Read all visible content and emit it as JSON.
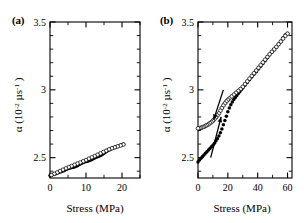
{
  "figure": {
    "panels": [
      {
        "tag": "(a)",
        "xlabel": "Stress (MPa)",
        "ylabel_alpha": "α",
        "ylabel_unit_open": " (10",
        "ylabel_unit_sup1": "-2",
        "ylabel_unit_mid": " µs",
        "ylabel_unit_sup2": "-1",
        "ylabel_unit_close": " )",
        "xticks": [
          "0",
          "10",
          "20"
        ],
        "yticks": [
          "2.5",
          "3",
          "3.5"
        ]
      },
      {
        "tag": "(b)",
        "xlabel": "Stress (MPa)",
        "ylabel_alpha": "α",
        "ylabel_unit_open": " (10",
        "ylabel_unit_sup1": "-2",
        "ylabel_unit_mid": " µs",
        "ylabel_unit_sup2": "-1",
        "ylabel_unit_close": " )",
        "xticks": [
          "0",
          "20",
          "40",
          "60"
        ],
        "yticks": [
          "2.5",
          "3",
          "3.5"
        ]
      }
    ]
  },
  "chart_data": [
    {
      "type": "scatter",
      "panel": "(a)",
      "title": "",
      "xlabel": "Stress (MPa)",
      "ylabel": "α (10-2 µs-1)",
      "xlim": [
        0,
        25
      ],
      "ylim": [
        2.35,
        3.5
      ],
      "xticks": [
        0,
        10,
        20
      ],
      "yticks": [
        2.5,
        3,
        3.5
      ],
      "xminor_step": 5,
      "yminor_step": 0.1,
      "grid": false,
      "legend": null,
      "series": [
        {
          "name": "loading (filled circles)",
          "marker": "filled-circle",
          "x": [
            0.0,
            0.4,
            0.8,
            1.2,
            1.6,
            2.0,
            2.4,
            2.8,
            3.2,
            3.6,
            4.0,
            4.4,
            4.8,
            5.2,
            5.6,
            6.0,
            6.4,
            6.8,
            7.2,
            7.6,
            8.0,
            8.4,
            8.8,
            9.2,
            9.6,
            10.0,
            10.4,
            10.8,
            11.2,
            11.6,
            12.0,
            12.4,
            12.8,
            13.2,
            13.6,
            14.0,
            14.4,
            14.8,
            15.2,
            15.6,
            16.0,
            16.4,
            16.8,
            17.2,
            17.6,
            18.0,
            18.4,
            18.8,
            19.2,
            19.6,
            20.0,
            20.4
          ],
          "y": [
            2.368,
            2.371,
            2.375,
            2.379,
            2.382,
            2.386,
            2.39,
            2.394,
            2.398,
            2.402,
            2.406,
            2.412,
            2.417,
            2.421,
            2.424,
            2.427,
            2.429,
            2.432,
            2.436,
            2.441,
            2.447,
            2.453,
            2.459,
            2.464,
            2.468,
            2.471,
            2.474,
            2.477,
            2.481,
            2.486,
            2.492,
            2.498,
            2.503,
            2.507,
            2.511,
            2.516,
            2.522,
            2.529,
            2.536,
            2.543,
            2.55,
            2.556,
            2.562,
            2.567,
            2.571,
            2.575,
            2.579,
            2.583,
            2.587,
            2.591,
            2.595,
            2.598
          ]
        },
        {
          "name": "unloading (open circles)",
          "marker": "open-circle",
          "x": [
            20.4,
            19.6,
            18.8,
            18.0,
            17.2,
            16.4,
            15.6,
            14.8,
            14.0,
            13.2,
            12.4,
            11.6,
            10.8,
            10.0,
            9.2,
            8.4,
            7.6,
            6.8,
            6.0,
            5.2,
            4.4,
            3.6,
            2.8,
            2.0,
            1.2,
            0.4
          ],
          "y": [
            2.597,
            2.59,
            2.583,
            2.576,
            2.569,
            2.561,
            2.551,
            2.541,
            2.531,
            2.521,
            2.511,
            2.502,
            2.492,
            2.482,
            2.473,
            2.464,
            2.456,
            2.447,
            2.438,
            2.43,
            2.421,
            2.411,
            2.401,
            2.391,
            2.381,
            2.372
          ]
        }
      ]
    },
    {
      "type": "scatter",
      "panel": "(b)",
      "title": "",
      "xlabel": "Stress (MPa)",
      "ylabel": "α (10-2 µs-1)",
      "xlim": [
        0,
        63
      ],
      "ylim": [
        2.35,
        3.5
      ],
      "xticks": [
        0,
        20,
        40,
        60
      ],
      "yticks": [
        2.5,
        3,
        3.5
      ],
      "xminor_step": 10,
      "yminor_step": 0.1,
      "grid": false,
      "legend": null,
      "annotations": [
        {
          "name": "loading-arrow",
          "text": "",
          "direction": "up-right",
          "x_from": 8.5,
          "y_from": 2.5,
          "x_to": 15.5,
          "y_to": 2.8
        },
        {
          "name": "unloading-arrow",
          "text": "",
          "direction": "down-left",
          "x_from": 17.0,
          "y_from": 3.0,
          "x_to": 10.5,
          "y_to": 2.78
        }
      ],
      "series": [
        {
          "name": "loading (filled circles)",
          "marker": "filled-circle",
          "x": [
            0.0,
            1.0,
            2.0,
            3.0,
            4.0,
            5.0,
            6.0,
            7.0,
            8.0,
            9.0,
            10.0,
            11.0,
            12.0,
            13.0,
            14.0,
            15.0,
            16.0,
            17.0,
            18.0,
            19.0,
            20.0,
            21.0,
            22.0,
            23.0,
            24.0,
            25.0,
            26.0,
            27.0,
            28.0,
            29.0,
            30.0,
            31.5,
            33.0,
            34.5,
            36.0,
            37.5,
            39.0,
            40.5,
            42.0,
            43.5,
            45.0,
            46.5,
            48.0,
            49.5,
            51.0,
            52.5,
            54.0,
            55.5,
            57.0,
            58.5,
            60.0
          ],
          "y": [
            2.468,
            2.482,
            2.495,
            2.508,
            2.52,
            2.532,
            2.544,
            2.556,
            2.568,
            2.58,
            2.592,
            2.606,
            2.622,
            2.64,
            2.66,
            2.684,
            2.712,
            2.742,
            2.774,
            2.806,
            2.838,
            2.866,
            2.89,
            2.91,
            2.928,
            2.944,
            2.958,
            2.972,
            2.986,
            3.0,
            3.014,
            3.034,
            3.054,
            3.074,
            3.094,
            3.114,
            3.134,
            3.154,
            3.174,
            3.194,
            3.214,
            3.236,
            3.258,
            3.278,
            3.296,
            3.314,
            3.334,
            3.356,
            3.382,
            3.404,
            3.416
          ]
        },
        {
          "name": "unloading (open circles)",
          "marker": "open-circle",
          "x": [
            60.0,
            58.5,
            57.0,
            55.5,
            54.0,
            52.5,
            51.0,
            49.5,
            48.0,
            46.5,
            45.0,
            43.5,
            42.0,
            40.5,
            39.0,
            37.5,
            36.0,
            34.5,
            33.0,
            31.5,
            30.0,
            28.5,
            27.0,
            25.5,
            24.0,
            22.5,
            21.0,
            20.0,
            19.0,
            18.0,
            17.0,
            16.0,
            15.0,
            14.0,
            13.0,
            12.0,
            11.0,
            10.0,
            9.0,
            8.0,
            7.0,
            6.0,
            5.0,
            4.0,
            3.0,
            2.0,
            1.0,
            0.0
          ],
          "y": [
            3.414,
            3.398,
            3.378,
            3.356,
            3.336,
            3.316,
            3.298,
            3.28,
            3.262,
            3.242,
            3.222,
            3.202,
            3.182,
            3.162,
            3.142,
            3.122,
            3.102,
            3.082,
            3.062,
            3.042,
            3.022,
            3.006,
            2.992,
            2.978,
            2.964,
            2.95,
            2.936,
            2.926,
            2.914,
            2.9,
            2.884,
            2.866,
            2.846,
            2.826,
            2.81,
            2.796,
            2.784,
            2.772,
            2.762,
            2.754,
            2.746,
            2.74,
            2.734,
            2.728,
            2.724,
            2.72,
            2.718,
            2.716
          ]
        }
      ]
    }
  ]
}
